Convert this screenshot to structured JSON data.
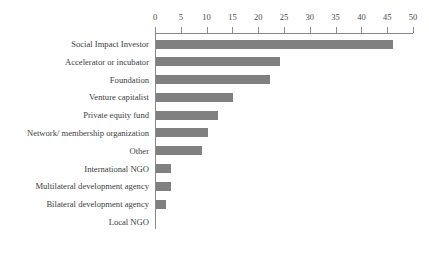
{
  "chart_data": {
    "type": "bar",
    "orientation": "horizontal",
    "title": "",
    "xlabel": "",
    "ylabel": "",
    "xlim": [
      0,
      50
    ],
    "xticks": [
      0,
      5,
      10,
      15,
      20,
      25,
      30,
      35,
      40,
      45,
      50
    ],
    "grid": false,
    "legend": false,
    "bar_color": "#808080",
    "axis_color": "#8a8a8a",
    "background": "#ffffff",
    "categories": [
      "Social Impact Investor",
      "Accelerator or incubator",
      "Foundation",
      "Venture capitalist",
      "Private equity fund",
      "Network/ membership organization",
      "Other",
      "International NGO",
      "Multilateral development agency",
      "Bilateral development agency",
      "Local NGO"
    ],
    "values": [
      46,
      24,
      22,
      15,
      12,
      10,
      9,
      3,
      3,
      2,
      0
    ]
  }
}
